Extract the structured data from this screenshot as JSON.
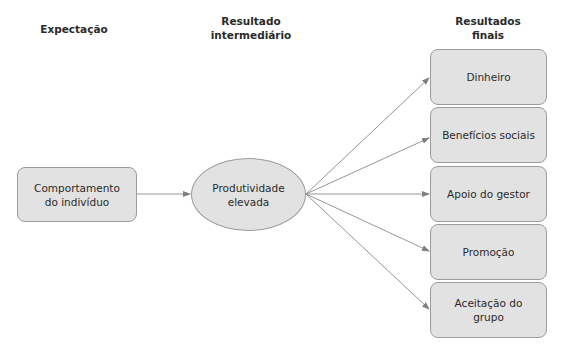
{
  "headers": {
    "expectation": "Expectação",
    "intermediate": "Resultado\nintermediário",
    "final": "Resultados\nfinais"
  },
  "nodes": {
    "behavior": "Comportamento\ndo indivíduo",
    "productivity": "Produtividade\nelevada",
    "outcomes": [
      {
        "label": "Dinheiro"
      },
      {
        "label": "Benefícios sociais"
      },
      {
        "label": "Apoio do gestor"
      },
      {
        "label": "Promoção"
      },
      {
        "label": "Aceitação do\ngrupo"
      }
    ]
  },
  "colors": {
    "node_fill": "#e2e2e2",
    "node_border": "#9c9c9c",
    "arrow": "#808080"
  }
}
